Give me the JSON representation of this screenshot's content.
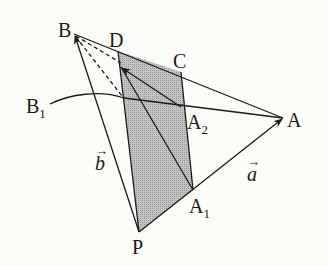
{
  "figure": {
    "type": "geometry-diagram",
    "points": {
      "B": {
        "label": "B",
        "x": 74,
        "y": 34
      },
      "D": {
        "label": "D",
        "x": 118,
        "y": 51
      },
      "C": {
        "label": "C",
        "x": 181,
        "y": 72
      },
      "A": {
        "label": "A",
        "x": 283,
        "y": 118
      },
      "A2": {
        "label": "A",
        "sub": "2",
        "x": 181,
        "y": 107
      },
      "A1": {
        "label": "A",
        "sub": "1",
        "x": 193,
        "y": 190
      },
      "P": {
        "label": "P",
        "x": 139,
        "y": 232
      },
      "B1": {
        "label": "B",
        "sub": "1",
        "x": 40,
        "y": 110
      }
    },
    "vectors": {
      "b": {
        "label": "b",
        "arrow": "→"
      },
      "a": {
        "label": "a",
        "arrow": "→"
      }
    },
    "colors": {
      "line": "#1a1a1a",
      "shade": "#b5b5b5",
      "background": "#fbfbf7"
    }
  }
}
